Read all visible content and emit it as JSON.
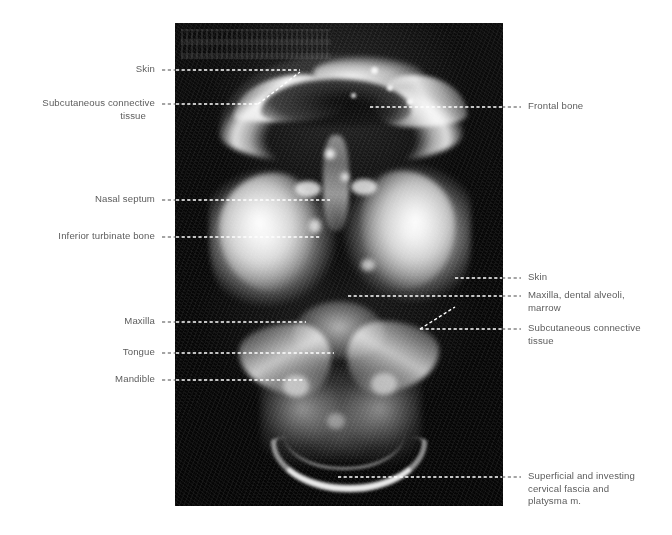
{
  "figure": {
    "kind": "labeled-anatomical-mri",
    "modality": "MRI",
    "plane": "coronal",
    "region": "head and neck",
    "background_color": "#ffffff",
    "text_color": "#5d5d5d",
    "leader_color_over_image": "#ffffff",
    "leader_color_over_background": "#4a4a4a",
    "scan_color": "#060606",
    "scan_rect": {
      "x": 175,
      "y": 23,
      "width": 328,
      "height": 483
    }
  },
  "labels": {
    "left": [
      {
        "id": "skin-top",
        "text": "Skin",
        "x": 155,
        "y": 70,
        "leader_y": 70,
        "leader_from_x": 162,
        "leader_to_x": 300
      },
      {
        "id": "subcutaneous-connective-top",
        "text": "Subcutaneous connective\ntissue",
        "x": 155,
        "y": 104,
        "leader_y": 104,
        "leader_from_x": 162,
        "leader_to_x": 258
      },
      {
        "id": "nasal-septum",
        "text": "Nasal septum",
        "x": 155,
        "y": 200,
        "leader_y": 200,
        "leader_from_x": 162,
        "leader_to_x": 330
      },
      {
        "id": "inferior-turbinate-bone",
        "text": "Inferior turbinate bone",
        "x": 155,
        "y": 237,
        "leader_y": 237,
        "leader_from_x": 162,
        "leader_to_x": 320
      },
      {
        "id": "maxilla",
        "text": "Maxilla",
        "x": 155,
        "y": 322,
        "leader_y": 322,
        "leader_from_x": 162,
        "leader_to_x": 306
      },
      {
        "id": "tongue",
        "text": "Tongue",
        "x": 155,
        "y": 353,
        "leader_y": 353,
        "leader_from_x": 162,
        "leader_to_x": 334
      },
      {
        "id": "mandible",
        "text": "Mandible",
        "x": 155,
        "y": 380,
        "leader_y": 380,
        "leader_from_x": 162,
        "leader_to_x": 305
      }
    ],
    "right": [
      {
        "id": "frontal-bone",
        "text": "Frontal bone",
        "x": 528,
        "y": 107,
        "leader_y": 107,
        "leader_from_x": 370,
        "leader_to_x": 520
      },
      {
        "id": "skin-lateral",
        "text": "Skin",
        "x": 528,
        "y": 278,
        "leader_y": 278,
        "leader_from_x": 455,
        "leader_to_x": 520
      },
      {
        "id": "maxilla-dental-alveoli",
        "text": "Maxilla, dental alveoli,\nmarrow",
        "x": 528,
        "y": 301,
        "leader_y": 296,
        "leader_from_x": 348,
        "leader_to_x": 520
      },
      {
        "id": "subcutaneous-connective-lateral",
        "text": "Subcutaneous connective\ntissue",
        "x": 528,
        "y": 334,
        "leader_y": 329,
        "leader_from_x": 420,
        "leader_to_x": 520
      },
      {
        "id": "cervical-fascia-platysma",
        "text": "Superficial and investing\ncervical fascia and\nplatysma m.",
        "x": 528,
        "y": 477,
        "leader_y": 477,
        "leader_from_x": 338,
        "leader_to_x": 520
      }
    ]
  }
}
